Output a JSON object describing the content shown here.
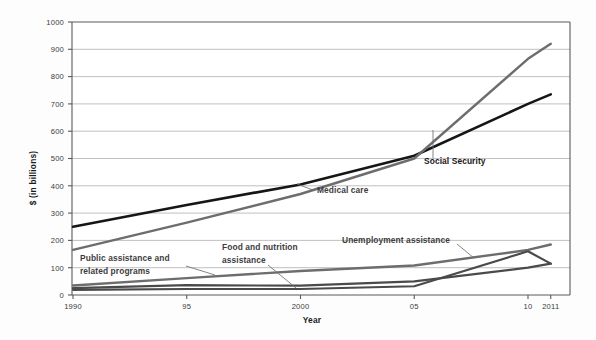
{
  "chart_data": {
    "type": "line",
    "title": "",
    "xlabel": "Year",
    "ylabel": "$ (in billions)",
    "x": [
      1990,
      1995,
      2000,
      2005,
      2010,
      2011
    ],
    "xtick_labels": [
      "1990",
      "95",
      "2000",
      "05",
      "10",
      "2011"
    ],
    "ytick_labels": [
      "0",
      "100",
      "200",
      "300",
      "400",
      "500",
      "600",
      "700",
      "800",
      "900",
      "1000"
    ],
    "ytick_values": [
      0,
      100,
      200,
      300,
      400,
      500,
      600,
      700,
      800,
      900,
      1000
    ],
    "ylim": [
      0,
      1000
    ],
    "xlim": [
      1990,
      2011
    ],
    "grid": true,
    "legend_position": "inline-annotations",
    "series": [
      {
        "name": "Social Security",
        "label": "Social Security",
        "color": "#161616",
        "width": 2.6,
        "values": [
          250,
          330,
          405,
          510,
          700,
          735
        ]
      },
      {
        "name": "Medical care",
        "label": "Medical care",
        "color": "#6d6d6d",
        "width": 2.4,
        "values": [
          165,
          265,
          370,
          500,
          865,
          920
        ]
      },
      {
        "name": "Public assistance and related programs",
        "label": "Public assistance and related programs",
        "color": "#6d6d6d",
        "width": 2.4,
        "values": [
          35,
          62,
          88,
          108,
          165,
          185
        ]
      },
      {
        "name": "Food and nutrition assistance",
        "label": "Food and nutrition assistance",
        "color": "#4a4a4a",
        "width": 2.2,
        "values": [
          25,
          36,
          34,
          50,
          100,
          115
        ]
      },
      {
        "name": "Unemployment assistance",
        "label": "Unemployment assistance",
        "color": "#4a4a4a",
        "width": 2.2,
        "values": [
          19,
          22,
          22,
          32,
          160,
          115
        ]
      }
    ],
    "annotations": [
      {
        "text": "Social Security",
        "x": 424,
        "y": 164
      },
      {
        "text": "Medical care",
        "x": 317,
        "y": 193
      },
      {
        "text": "Public assistance and",
        "x": 80,
        "y": 261
      },
      {
        "text": "related programs",
        "x": 80,
        "y": 274
      },
      {
        "text": "Food and nutrition",
        "x": 222,
        "y": 250
      },
      {
        "text": "assistance",
        "x": 222,
        "y": 263
      },
      {
        "text": "Unemployment assistance",
        "x": 342,
        "y": 243
      }
    ]
  }
}
